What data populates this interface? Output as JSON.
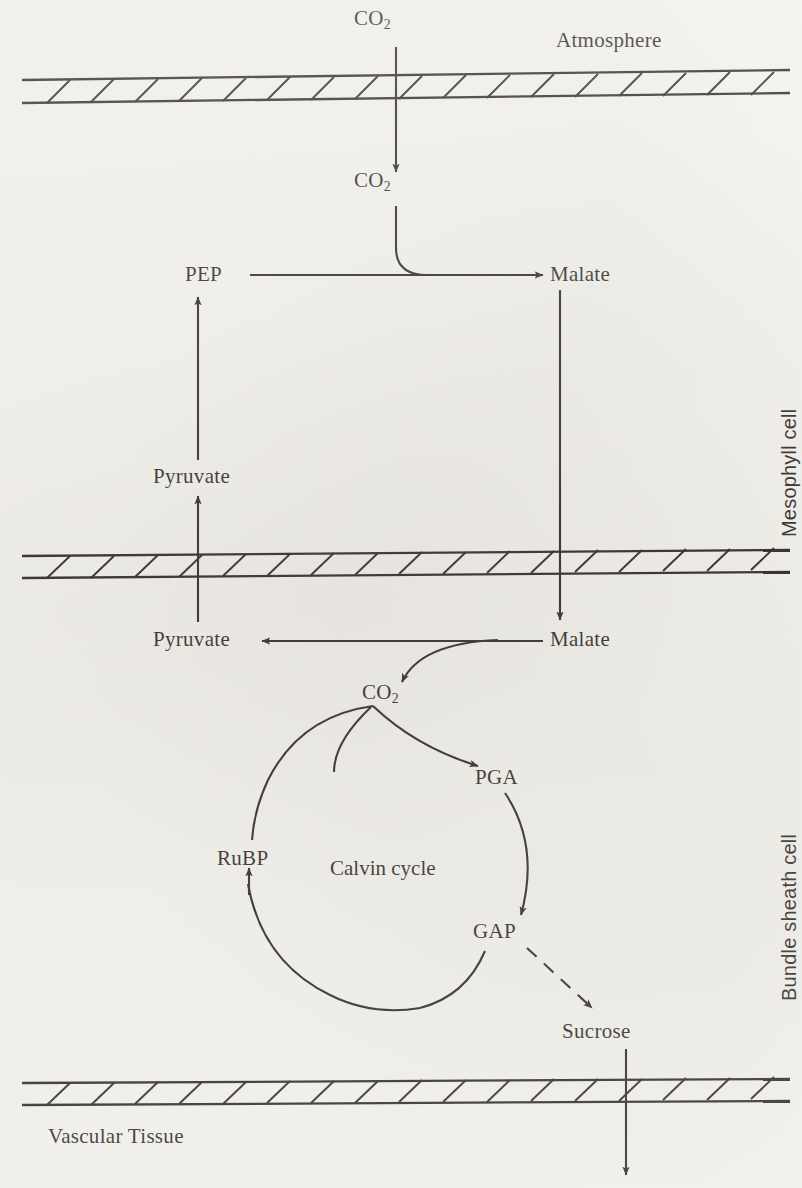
{
  "diagram": {
    "background_color": "#f3f2ee",
    "ink_color": "#15120f",
    "regions": [
      {
        "id": "atmosphere",
        "label": "Atmosphere",
        "orientation": "horizontal"
      },
      {
        "id": "mesophyll",
        "label": "Mesophyll cell",
        "orientation": "vertical"
      },
      {
        "id": "bundle_sheath",
        "label": "Bundle sheath cell",
        "orientation": "vertical"
      },
      {
        "id": "vascular",
        "label": "Vascular Tissue",
        "orientation": "horizontal"
      }
    ],
    "membranes": [
      {
        "id": "membrane-top",
        "y": 88
      },
      {
        "id": "membrane-middle",
        "y": 563
      },
      {
        "id": "membrane-bottom",
        "y": 1090
      }
    ],
    "nodes": [
      {
        "id": "co2-atmosphere",
        "label": "CO",
        "sub": "2",
        "x": 388,
        "y": 18
      },
      {
        "id": "co2-mesophyll",
        "label": "CO",
        "sub": "2",
        "x": 388,
        "y": 180
      },
      {
        "id": "pep",
        "label": "PEP",
        "x": 201,
        "y": 267
      },
      {
        "id": "malate-mesophyll",
        "label": "Malate",
        "x": 560,
        "y": 267
      },
      {
        "id": "pyruvate-mesophyll",
        "label": "Pyruvate",
        "x": 200,
        "y": 472
      },
      {
        "id": "pyruvate-bundle",
        "label": "Pyruvate",
        "x": 200,
        "y": 635
      },
      {
        "id": "malate-bundle",
        "label": "Malate",
        "x": 560,
        "y": 635
      },
      {
        "id": "co2-bundle",
        "label": "CO",
        "sub": "2",
        "x": 390,
        "y": 688
      },
      {
        "id": "pga",
        "label": "PGA",
        "x": 495,
        "y": 775
      },
      {
        "id": "gap",
        "label": "GAP",
        "x": 496,
        "y": 930
      },
      {
        "id": "rubp",
        "label": "RuBP",
        "x": 217,
        "y": 857
      },
      {
        "id": "sucrose",
        "label": "Sucrose",
        "x": 595,
        "y": 1032
      }
    ],
    "cycle": {
      "id": "calvin-cycle",
      "caption": "Calvin cycle",
      "center_x": 394,
      "center_y": 866,
      "radius": 128
    },
    "arrows": [
      {
        "id": "arrow-atmosphere-to-mesophyll-co2",
        "from": "co2-atmosphere",
        "to": "co2-mesophyll",
        "style": "solid",
        "crosses": "membrane-top"
      },
      {
        "id": "arrow-co2-to-malate",
        "from": "co2-mesophyll",
        "to": "malate-mesophyll",
        "style": "solid-curved"
      },
      {
        "id": "arrow-pep-to-malate",
        "from": "pep",
        "to": "malate-mesophyll",
        "style": "solid"
      },
      {
        "id": "arrow-pyruvate-to-pep",
        "from": "pyruvate-mesophyll",
        "to": "pep",
        "style": "solid"
      },
      {
        "id": "arrow-pyruvate-bundle-to-mesophyll",
        "from": "pyruvate-bundle",
        "to": "pyruvate-mesophyll",
        "style": "solid",
        "crosses": "membrane-middle"
      },
      {
        "id": "arrow-malate-mesophyll-to-bundle",
        "from": "malate-mesophyll",
        "to": "malate-bundle",
        "style": "solid",
        "crosses": "membrane-middle"
      },
      {
        "id": "arrow-malate-to-pyruvate",
        "from": "malate-bundle",
        "to": "pyruvate-bundle",
        "style": "solid"
      },
      {
        "id": "arrow-malate-to-co2",
        "from": "malate-bundle",
        "to": "co2-bundle",
        "style": "solid-curved"
      },
      {
        "id": "arrow-co2-to-pga",
        "from": "co2-bundle",
        "to": "pga",
        "style": "solid-curved"
      },
      {
        "id": "arrow-pga-to-gap",
        "from": "pga",
        "to": "gap",
        "style": "solid-curved"
      },
      {
        "id": "arrow-gap-to-rubp",
        "from": "gap",
        "to": "rubp",
        "style": "solid-curved"
      },
      {
        "id": "arrow-gap-to-sucrose",
        "from": "gap",
        "to": "sucrose",
        "style": "dashed"
      },
      {
        "id": "arrow-sucrose-to-vascular",
        "from": "sucrose",
        "to": "vascular",
        "style": "solid",
        "crosses": "membrane-bottom"
      }
    ]
  }
}
